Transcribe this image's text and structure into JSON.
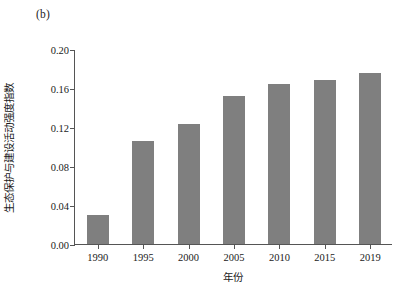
{
  "figure": {
    "panel_label": "(b)",
    "background_color": "#ffffff"
  },
  "chart_data": {
    "type": "bar",
    "title": "",
    "subtitle": "",
    "panel_label": "(b)",
    "categories": [
      "1990",
      "1995",
      "2000",
      "2005",
      "2010",
      "2015",
      "2019"
    ],
    "values": [
      0.03,
      0.106,
      0.123,
      0.152,
      0.164,
      0.168,
      0.175
    ],
    "series": [
      {
        "name": "生态保护与建设活动强度指数",
        "values": [
          0.03,
          0.106,
          0.123,
          0.152,
          0.164,
          0.168,
          0.175
        ],
        "color": "#7f7f7f"
      }
    ],
    "xlabel": "年份",
    "ylabel": "生态保护与建设活动强度指数",
    "ylim": [
      0.0,
      0.2
    ],
    "yticks": [
      "0.00",
      "0.04",
      "0.08",
      "0.12",
      "0.16",
      "0.20"
    ],
    "ytick_values": [
      0.0,
      0.04,
      0.08,
      0.12,
      0.16,
      0.2
    ],
    "xticks": [
      "1990",
      "1995",
      "2000",
      "2005",
      "2010",
      "2015",
      "2019"
    ],
    "grid": false,
    "legend": false,
    "legend_position": "none",
    "bar_color": "#7f7f7f",
    "axis_color": "#555555",
    "annotations": []
  },
  "axes": {
    "y": {
      "title": "生态保护与建设活动强度指数",
      "ticks": [
        {
          "label": "0.00",
          "value": 0.0
        },
        {
          "label": "0.04",
          "value": 0.04
        },
        {
          "label": "0.08",
          "value": 0.08
        },
        {
          "label": "0.12",
          "value": 0.12
        },
        {
          "label": "0.16",
          "value": 0.16
        },
        {
          "label": "0.20",
          "value": 0.2
        }
      ],
      "min": 0.0,
      "max": 0.2
    },
    "x": {
      "title": "年份",
      "ticks": [
        {
          "label": "1990",
          "value": 0.03
        },
        {
          "label": "1995",
          "value": 0.106
        },
        {
          "label": "2000",
          "value": 0.123
        },
        {
          "label": "2005",
          "value": 0.152
        },
        {
          "label": "2010",
          "value": 0.164
        },
        {
          "label": "2015",
          "value": 0.168
        },
        {
          "label": "2019",
          "value": 0.175
        }
      ]
    }
  }
}
